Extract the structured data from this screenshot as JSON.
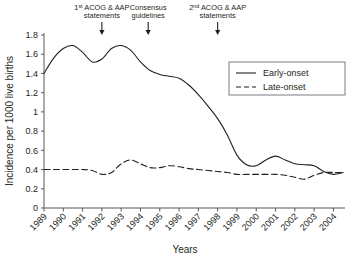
{
  "chart_data": {
    "type": "line",
    "title": "",
    "xlabel": "Years",
    "ylabel": "Incidence per 1000 live births",
    "categories": [
      1989,
      1990,
      1991,
      1992,
      1993,
      1994,
      1995,
      1996,
      1997,
      1998,
      1999,
      2000,
      2001,
      2002,
      2003,
      2004
    ],
    "xtick_labels": [
      "1989",
      "1990",
      "1991",
      "1992",
      "1993",
      "1994",
      "1995",
      "1996",
      "1997",
      "1998",
      "1999",
      "2000",
      "2001",
      "2002",
      "2003",
      "2004"
    ],
    "ytick_labels": [
      "0",
      "0.2",
      "0.4",
      "0.6",
      "0.8",
      "1",
      "1.2",
      "1.4",
      "1.6",
      "1.8"
    ],
    "ylim": [
      0,
      1.8
    ],
    "xlim": [
      1989,
      2004.6
    ],
    "ytick_step": 0.2,
    "grid": false,
    "legend_position": "upper-right",
    "series": [
      {
        "name": "Early-onset",
        "style": "solid",
        "x": [
          1989.0,
          1989.5,
          1990.0,
          1990.5,
          1991.0,
          1991.5,
          1992.0,
          1992.5,
          1993.0,
          1993.5,
          1994.0,
          1994.5,
          1995.0,
          1995.5,
          1996.0,
          1996.5,
          1997.0,
          1997.5,
          1998.0,
          1998.5,
          1999.0,
          1999.5,
          2000.0,
          2000.5,
          2001.0,
          2001.5,
          2002.0,
          2002.5,
          2003.0,
          2003.5,
          2004.0,
          2004.5
        ],
        "values": [
          1.4,
          1.56,
          1.66,
          1.69,
          1.62,
          1.52,
          1.55,
          1.66,
          1.69,
          1.64,
          1.52,
          1.43,
          1.39,
          1.37,
          1.35,
          1.28,
          1.18,
          1.06,
          0.93,
          0.76,
          0.55,
          0.45,
          0.44,
          0.5,
          0.54,
          0.5,
          0.46,
          0.45,
          0.44,
          0.38,
          0.35,
          0.37
        ]
      },
      {
        "name": "Late-onset",
        "style": "dashed",
        "x": [
          1989.0,
          1989.5,
          1990.0,
          1990.5,
          1991.0,
          1991.5,
          1992.0,
          1992.5,
          1993.0,
          1993.5,
          1994.0,
          1994.5,
          1995.0,
          1995.5,
          1996.0,
          1996.5,
          1997.0,
          1997.5,
          1998.0,
          1998.5,
          1999.0,
          1999.5,
          2000.0,
          2000.5,
          2001.0,
          2001.5,
          2002.0,
          2002.5,
          2003.0,
          2003.5,
          2004.0,
          2004.5
        ],
        "values": [
          0.4,
          0.4,
          0.4,
          0.4,
          0.4,
          0.39,
          0.35,
          0.37,
          0.46,
          0.5,
          0.46,
          0.42,
          0.42,
          0.44,
          0.43,
          0.41,
          0.4,
          0.39,
          0.38,
          0.37,
          0.35,
          0.35,
          0.35,
          0.35,
          0.35,
          0.34,
          0.32,
          0.3,
          0.34,
          0.37,
          0.37,
          0.37
        ]
      }
    ],
    "annotations": [
      {
        "id": "acog-1",
        "line1_prefix": "1",
        "line1_sup": "st",
        "line1_rest": " ACOG & AAP",
        "line2": "statements",
        "x": 1992.0
      },
      {
        "id": "consensus",
        "line1_prefix": "Consensus",
        "line1_sup": "",
        "line1_rest": "",
        "line2": "guidelines",
        "x": 1994.4
      },
      {
        "id": "acog-2",
        "line1_prefix": "2",
        "line1_sup": "nd",
        "line1_rest": " ACOG & AAP",
        "line2": "statements",
        "x": 1998.0
      }
    ]
  },
  "legend": {
    "entries": [
      {
        "label": "Early-onset"
      },
      {
        "label": "Late-onset"
      }
    ]
  },
  "colors": {
    "line": "#231f20",
    "axis": "#58595b",
    "background": "#ffffff"
  }
}
